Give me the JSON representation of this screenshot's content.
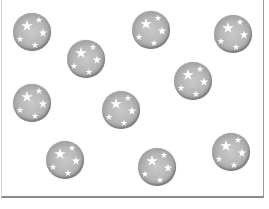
{
  "game": {
    "title": "",
    "board": {
      "width": 263,
      "height": 200
    },
    "ball_style": {
      "color": "#b8b8b8",
      "rim": "#6f6f6f",
      "star_color": "#ffffff"
    },
    "balls": [
      {
        "id": 1,
        "cx": 32,
        "cy": 32,
        "icon": "star-ball"
      },
      {
        "id": 2,
        "cx": 86,
        "cy": 59,
        "icon": "star-ball"
      },
      {
        "id": 3,
        "cx": 151,
        "cy": 30,
        "icon": "star-ball"
      },
      {
        "id": 4,
        "cx": 233,
        "cy": 34,
        "icon": "star-ball"
      },
      {
        "id": 5,
        "cx": 193,
        "cy": 81,
        "icon": "star-ball"
      },
      {
        "id": 6,
        "cx": 32,
        "cy": 103,
        "icon": "star-ball"
      },
      {
        "id": 7,
        "cx": 121,
        "cy": 110,
        "icon": "star-ball"
      },
      {
        "id": 8,
        "cx": 65,
        "cy": 160,
        "icon": "star-ball"
      },
      {
        "id": 9,
        "cx": 157,
        "cy": 167,
        "icon": "star-ball"
      },
      {
        "id": 10,
        "cx": 231,
        "cy": 152,
        "icon": "star-ball"
      }
    ]
  }
}
